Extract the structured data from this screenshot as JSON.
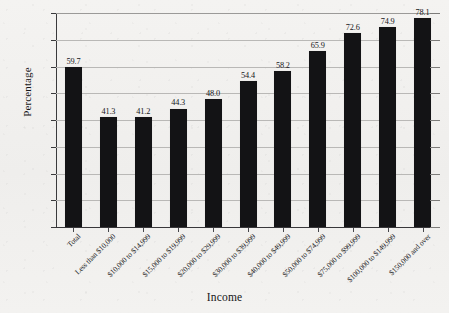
{
  "chart_data": {
    "type": "bar",
    "title": "",
    "subtitle": "",
    "xlabel": "Income",
    "ylabel": "Percentage",
    "categories": [
      "Total",
      "Less than $10,000",
      "$10,000 to $14,999",
      "$15,000 to $19,999",
      "$20,000 to $29,999",
      "$30,000 to $39,999",
      "$40,000 to $49,999",
      "$50,000 to $74,999",
      "$75,000 to $99,999",
      "$100,000 to $149,999",
      "$150,000 and over"
    ],
    "values": [
      59.7,
      41.3,
      41.2,
      44.3,
      48.0,
      54.4,
      58.2,
      65.9,
      72.6,
      74.9,
      78.1
    ],
    "value_labels": [
      "59.7",
      "41.3",
      "41.2",
      "44.3",
      "48.0",
      "54.4",
      "58.2",
      "65.9",
      "72.6",
      "74.9",
      "78.1"
    ],
    "ylim": [
      0.0,
      80.0
    ],
    "ytick_labels": [
      "0.0",
      "10.0",
      "20.0",
      "30.0",
      "40.0",
      "50.0",
      "60.0",
      "70.0",
      "80.0"
    ],
    "ytick_values": [
      0,
      10,
      20,
      30,
      40,
      50,
      60,
      70,
      80
    ],
    "grid": true,
    "grid_axis": "y",
    "legend": false,
    "legend_position": "none",
    "bar_color": "#131315",
    "grid_color": "#b9b8b6",
    "axis_color": "#3a3a3c",
    "background_color": "#f2f1ef",
    "xtick_label_rotation": -45
  }
}
